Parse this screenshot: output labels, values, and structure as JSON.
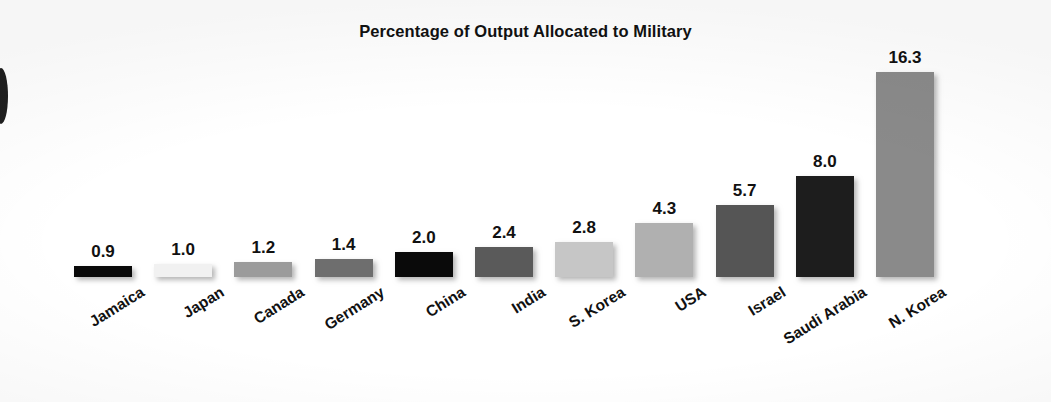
{
  "chart_data": {
    "type": "bar",
    "title": "Percentage of Output Allocated to Military",
    "xlabel": "",
    "ylabel": "",
    "ylim": [
      0,
      16.3
    ],
    "grid": false,
    "legend": false,
    "value_label_format": "one-decimal",
    "categories": [
      "Jamaica",
      "Japan",
      "Canada",
      "Germany",
      "China",
      "India",
      "S. Korea",
      "USA",
      "Israel",
      "Saudi Arabia",
      "N. Korea"
    ],
    "values": [
      0.9,
      1.0,
      1.2,
      1.4,
      2.0,
      2.4,
      2.8,
      4.3,
      5.7,
      8.0,
      16.3
    ],
    "value_labels": [
      "0.9",
      "1.0",
      "1.2",
      "1.4",
      "2.0",
      "2.4",
      "2.8",
      "4.3",
      "5.7",
      "8.0",
      "16.3"
    ],
    "bar_colors": [
      "#0a0a0a",
      "#f1f1f1",
      "#9b9b9b",
      "#6e6e6e",
      "#0a0a0a",
      "#5a5a5a",
      "#c6c6c6",
      "#b0b0b0",
      "#555555",
      "#1d1d1d",
      "#8a8a8a"
    ],
    "highlighted_category": "USA",
    "highlight_style": "bold-label"
  },
  "artifact": {
    "name": "page-edge-mark"
  }
}
